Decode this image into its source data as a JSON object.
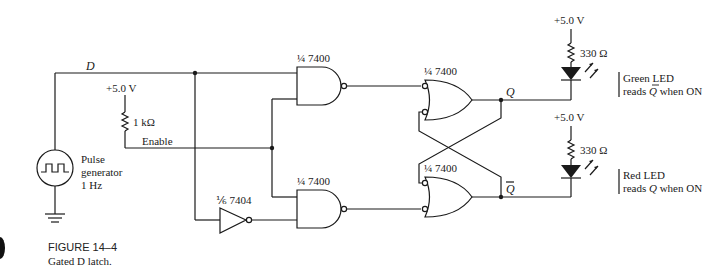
{
  "figure": {
    "number": "FIGURE 14–4",
    "caption": "Gated D latch."
  },
  "labels": {
    "d_input": "D",
    "enable": "Enable",
    "supply_left": "+5.0 V",
    "pullup_resistor": "1 kΩ",
    "pulse_gen_line1": "Pulse",
    "pulse_gen_line2": "generator",
    "pulse_gen_line3": "1 Hz",
    "q_output": "Q",
    "qbar_output": "Q",
    "supply_top": "+5.0 V",
    "supply_bottom": "+5.0 V",
    "led_resistor_top": "330 Ω",
    "led_resistor_bottom": "330 Ω"
  },
  "gates": [
    {
      "id": "nand-top",
      "type": "NAND",
      "part": "7400",
      "fraction": "1/4",
      "label": "¼ 7400"
    },
    {
      "id": "nand-bottom",
      "type": "NAND",
      "part": "7400",
      "fraction": "1/4",
      "label": "¼ 7400"
    },
    {
      "id": "inverter",
      "type": "NOT",
      "part": "7404",
      "fraction": "1/6",
      "label": "⅙ 7404"
    },
    {
      "id": "or-top",
      "type": "NAND (negative-OR)",
      "part": "7400",
      "fraction": "1/4",
      "label": "¼ 7400"
    },
    {
      "id": "or-bottom",
      "type": "NAND (negative-OR)",
      "part": "7400",
      "fraction": "1/4",
      "label": "¼ 7400"
    }
  ],
  "leds": [
    {
      "id": "green",
      "line1": "Green LED",
      "line2_prefix": "reads ",
      "line2_var": "Q",
      "line2_var_overbar": true,
      "line2_suffix": " when ON"
    },
    {
      "id": "red",
      "line1": "Red LED",
      "line2_prefix": "reads ",
      "line2_var": "Q",
      "line2_var_overbar": false,
      "line2_suffix": " when ON"
    }
  ]
}
